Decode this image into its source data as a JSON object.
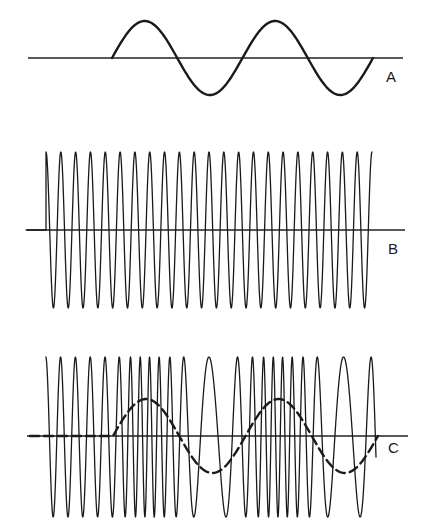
{
  "panels": [
    {
      "id": "A",
      "label": "A",
      "description": "Modulating signal",
      "axis": {
        "y": 58,
        "x1": 28,
        "x2": 403
      },
      "wave": {
        "start_x": 112,
        "end_x": 373,
        "cycles": 2,
        "amplitude": 37,
        "stroke_width": 2.4
      }
    },
    {
      "id": "B",
      "label": "B",
      "description": "Carrier wave",
      "axis": {
        "y": 230,
        "x1": 27,
        "x2": 405
      },
      "wave": {
        "start_x": 46,
        "end_x": 372,
        "cycles": 22,
        "top": 152,
        "bottom": 308,
        "stroke_width": 1.3
      }
    },
    {
      "id": "C",
      "label": "C",
      "description": "Frequency-modulated wave",
      "axis": {
        "y": 436,
        "x1": 27,
        "x2": 408
      },
      "wave": {
        "start_x": 46,
        "end_x": 376,
        "top": 357,
        "bottom": 517,
        "stroke_width": 1.3
      },
      "modulation_overlay": {
        "style": "dashed",
        "flat_start_x": 30,
        "start_x": 113,
        "end_x": 378,
        "cycles": 2,
        "amplitude": 37
      }
    }
  ],
  "colors": {
    "ink": "#1a1a1a",
    "background": "#ffffff"
  }
}
